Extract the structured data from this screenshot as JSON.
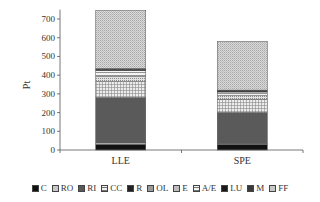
{
  "chart_data": {
    "type": "bar",
    "stacked": true,
    "title": "",
    "xlabel": "",
    "ylabel": "Pt",
    "ylim": [
      0,
      750
    ],
    "yticks": [
      0,
      100,
      200,
      300,
      400,
      500,
      600,
      700
    ],
    "categories": [
      "LLE",
      "SPE"
    ],
    "grid": false,
    "legend_position": "bottom",
    "series": [
      {
        "name": "C",
        "values": [
          30,
          30
        ],
        "fill": "#111111",
        "pattern": "solid"
      },
      {
        "name": "RO",
        "values": [
          8,
          5
        ],
        "fill": "#c8c8c8",
        "pattern": "solid"
      },
      {
        "name": "RI",
        "values": [
          242,
          165
        ],
        "fill": "#5a5a5a",
        "pattern": "solid"
      },
      {
        "name": "CC",
        "values": [
          85,
          70
        ],
        "fill": "#e6e6e6",
        "pattern": "grid"
      },
      {
        "name": "R",
        "values": [
          0,
          0
        ],
        "fill": "#222222",
        "pattern": "solid"
      },
      {
        "name": "OL",
        "values": [
          0,
          0
        ],
        "fill": "#9a9a9a",
        "pattern": "solid"
      },
      {
        "name": "E",
        "values": [
          27,
          20
        ],
        "fill": "#d0d0d0",
        "pattern": "dots"
      },
      {
        "name": "A/E",
        "values": [
          33,
          20
        ],
        "fill": "#f0f0f0",
        "pattern": "hstripe"
      },
      {
        "name": "LU",
        "values": [
          5,
          5
        ],
        "fill": "#1a1a1a",
        "pattern": "solid"
      },
      {
        "name": "M",
        "values": [
          5,
          5
        ],
        "fill": "#3a3a3a",
        "pattern": "solid"
      },
      {
        "name": "FF",
        "values": [
          310,
          260
        ],
        "fill": "#d4d4d4",
        "pattern": "fine-dots"
      }
    ]
  }
}
